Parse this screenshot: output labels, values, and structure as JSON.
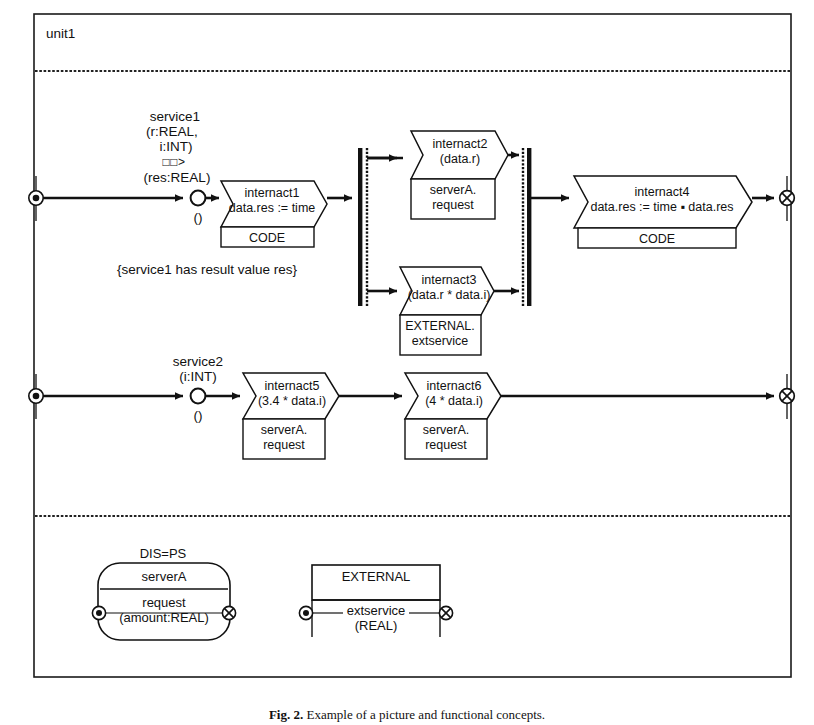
{
  "figure": {
    "unit_label": "unit1",
    "caption_prefix": "Fig. 2.",
    "caption_text": "Example of a picture and functional concepts.",
    "frame_color": "#1a1a1a",
    "line_color": "#111111",
    "background": "#ffffff"
  },
  "service1": {
    "name": "service1",
    "params_line1": "(r:REAL,",
    "params_line2": "i:INT)",
    "arrow_symbol": "□□>",
    "result": "(res:REAL)",
    "port_label": "()",
    "note": "{service1 has result value  res}"
  },
  "service2": {
    "name": "service2",
    "params_line1": "(i:INT)",
    "port_label": "()"
  },
  "actions": [
    {
      "id": "internact1",
      "title": "internact1",
      "expr": "data.res := time",
      "body": "CODE",
      "body_line2": ""
    },
    {
      "id": "internact2",
      "title": "internact2",
      "expr": "(data.r)",
      "body": "serverA.",
      "body_line2": "request"
    },
    {
      "id": "internact3",
      "title": "internact3",
      "expr": "(data.r * data.i)",
      "body": "EXTERNAL.",
      "body_line2": "extservice"
    },
    {
      "id": "internact4",
      "title": "internact4",
      "expr": "data.res := time ▪ data.res",
      "body": "CODE",
      "body_line2": ""
    },
    {
      "id": "internact5",
      "title": "internact5",
      "expr": "(3.4 * data.i)",
      "body": "serverA.",
      "body_line2": "request"
    },
    {
      "id": "internact6",
      "title": "internact6",
      "expr": "(4 * data.i)",
      "body": "serverA.",
      "body_line2": "request"
    }
  ],
  "resources": {
    "server": {
      "stereotype": "DIS=PS",
      "name": "serverA",
      "operation": "request",
      "signature": "(amount:REAL)"
    },
    "external": {
      "name": "EXTERNAL",
      "operation": "extservice",
      "signature": "(REAL)"
    }
  },
  "icons": {
    "start_terminator": "filled-dot-in-circle-icon",
    "end_terminator": "crossed-circle-icon",
    "port": "open-circle-icon",
    "sync_bar": "synchronization-bar-icon"
  }
}
